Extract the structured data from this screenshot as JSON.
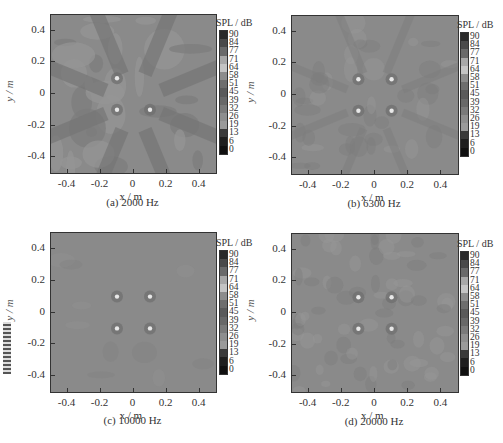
{
  "chart_data": [
    {
      "type": "heatmap",
      "caption": "(a) 2000 Hz",
      "frequency_hz": 2000,
      "xlabel": "x / m",
      "ylabel": "y / m",
      "xlim": [
        -0.5,
        0.5
      ],
      "ylim": [
        -0.5,
        0.5
      ],
      "xticks": [
        "-0.4",
        "-0.2",
        "0",
        "0.2",
        "0.4"
      ],
      "yticks": [
        "0.4",
        "0.2",
        "0",
        "-0.2",
        "-0.4"
      ],
      "colorbar_title": "SPL / dB",
      "colorbar_ticks": [
        "90",
        "84",
        "77",
        "71",
        "64",
        "58",
        "51",
        "45",
        "39",
        "32",
        "26",
        "19",
        "13",
        "6",
        "0"
      ],
      "sources": [
        {
          "x": -0.1,
          "y": 0.1
        },
        {
          "x": -0.1,
          "y": -0.1
        },
        {
          "x": 0.1,
          "y": -0.1
        }
      ],
      "pattern": "strong radial streaks and blobs"
    },
    {
      "type": "heatmap",
      "caption": "(b) 6300 Hz",
      "frequency_hz": 6300,
      "xlabel": "x / m",
      "ylabel": "y / m",
      "xlim": [
        -0.5,
        0.5
      ],
      "ylim": [
        -0.5,
        0.5
      ],
      "xticks": [
        "-0.4",
        "-0.2",
        "0",
        "0.2",
        "0.4"
      ],
      "yticks": [
        "0.4",
        "0.2",
        "0",
        "-0.2",
        "-0.4"
      ],
      "colorbar_title": "SPL / dB",
      "colorbar_ticks": [
        "90",
        "84",
        "77",
        "71",
        "64",
        "58",
        "51",
        "45",
        "39",
        "32",
        "26",
        "19",
        "13",
        "6",
        "0"
      ],
      "sources": [
        {
          "x": -0.1,
          "y": 0.1
        },
        {
          "x": 0.1,
          "y": 0.1
        },
        {
          "x": -0.1,
          "y": -0.1
        },
        {
          "x": 0.1,
          "y": -0.1
        }
      ],
      "pattern": "faint radial streaks"
    },
    {
      "type": "heatmap",
      "caption": "(c) 10000 Hz",
      "frequency_hz": 10000,
      "xlabel": "x / m",
      "ylabel": "y / m",
      "xlim": [
        -0.5,
        0.5
      ],
      "ylim": [
        -0.5,
        0.5
      ],
      "xticks": [
        "-0.4",
        "-0.2",
        "0",
        "0.2",
        "0.4"
      ],
      "yticks": [
        "0.4",
        "0.2",
        "0",
        "-0.2",
        "-0.4"
      ],
      "colorbar_title": "SPL / dB",
      "colorbar_ticks": [
        "90",
        "84",
        "77",
        "71",
        "64",
        "58",
        "51",
        "45",
        "39",
        "32",
        "26",
        "19",
        "13",
        "6",
        "0"
      ],
      "sources": [
        {
          "x": -0.1,
          "y": 0.1
        },
        {
          "x": 0.1,
          "y": 0.1
        },
        {
          "x": -0.1,
          "y": -0.1
        },
        {
          "x": 0.1,
          "y": -0.1
        }
      ],
      "pattern": "uniform background"
    },
    {
      "type": "heatmap",
      "caption": "(d) 20000 Hz",
      "frequency_hz": 20000,
      "xlabel": "x / m",
      "ylabel": "y / m",
      "xlim": [
        -0.5,
        0.5
      ],
      "ylim": [
        -0.5,
        0.5
      ],
      "xticks": [
        "-0.4",
        "-0.2",
        "0",
        "0.2",
        "0.4"
      ],
      "yticks": [
        "0.4",
        "0.2",
        "0",
        "-0.2",
        "-0.4"
      ],
      "colorbar_title": "SPL / dB",
      "colorbar_ticks": [
        "90",
        "84",
        "77",
        "71",
        "64",
        "58",
        "51",
        "45",
        "39",
        "32",
        "26",
        "19",
        "13",
        "6",
        "0"
      ],
      "sources": [
        {
          "x": -0.1,
          "y": 0.1
        },
        {
          "x": 0.1,
          "y": 0.1
        },
        {
          "x": -0.1,
          "y": -0.1
        },
        {
          "x": 0.1,
          "y": -0.1
        }
      ],
      "pattern": "mottled noise"
    }
  ],
  "labels": {
    "x_var": "x",
    "y_var": "y",
    "unit": " / m"
  },
  "colors": {
    "background_field": "#8a8a8a",
    "colorbar": [
      "#2a2a2a",
      "#4a4a4a",
      "#6a6a6a",
      "#a8a8a8",
      "#c4c4c4",
      "#8c8c8c",
      "#6e6e6e",
      "#5a5a5a",
      "#686868",
      "#7a7a7a",
      "#8e8e8e",
      "#9a9a9a",
      "#3a3a3a",
      "#1e1e1e",
      "#101010"
    ]
  }
}
